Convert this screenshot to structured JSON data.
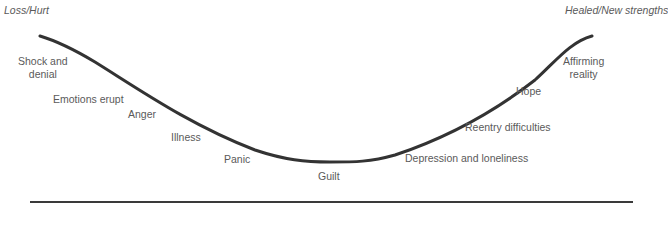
{
  "diagram": {
    "type": "u-curve",
    "start_label": "Loss/Hurt",
    "end_label": "Healed/New strengths",
    "stages": [
      {
        "label_line1": "Shock and",
        "label_line2": "denial"
      },
      {
        "label": "Emotions erupt"
      },
      {
        "label": "Anger"
      },
      {
        "label": "Illness"
      },
      {
        "label": "Panic"
      },
      {
        "label": "Guilt"
      },
      {
        "label": "Depression and loneliness"
      },
      {
        "label": "Reentry difficulties"
      },
      {
        "label": "Hope"
      },
      {
        "label_line1": "Affirming",
        "label_line2": "reality"
      }
    ],
    "colors": {
      "curve": "#333333",
      "text": "#5a5a5a",
      "rule": "#3a3a3a"
    }
  }
}
